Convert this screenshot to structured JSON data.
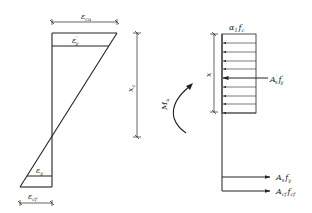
{
  "diagram": {
    "type": "strain-stress-section",
    "strain": {
      "top_dimension_label": "ε",
      "top_dimension_sub": "cu",
      "compression_steel_strain_label": "ε",
      "compression_steel_strain_sub": "y",
      "compression_steel_strain_sup": "′",
      "tension_steel_strain_label": "ε",
      "tension_steel_strain_sub": "y",
      "bottom_dimension_label": "ε",
      "bottom_dimension_sub": "cf"
    },
    "neutral_axis": {
      "label": "x",
      "sub": "c"
    },
    "moment": {
      "label": "M",
      "sub": "u"
    },
    "stress": {
      "block_label_alpha": "α",
      "block_label_alpha_sub": "1",
      "block_label_f": "f",
      "block_label_f_sub": "c",
      "block_depth_label": "x",
      "compression_steel_label_A": "A",
      "compression_steel_label_A_sub": "s",
      "compression_steel_label_A_sup": "′",
      "compression_steel_label_f": "f",
      "compression_steel_label_f_sub": "y",
      "compression_steel_label_f_sup": "′",
      "tension_steel_label_A": "A",
      "tension_steel_label_A_sub": "s",
      "tension_steel_label_f": "f",
      "tension_steel_label_f_sub": "y",
      "frp_label_A": "A",
      "frp_label_A_sub": "cf",
      "frp_label_f": "f",
      "frp_label_f_sub": "cf"
    }
  }
}
